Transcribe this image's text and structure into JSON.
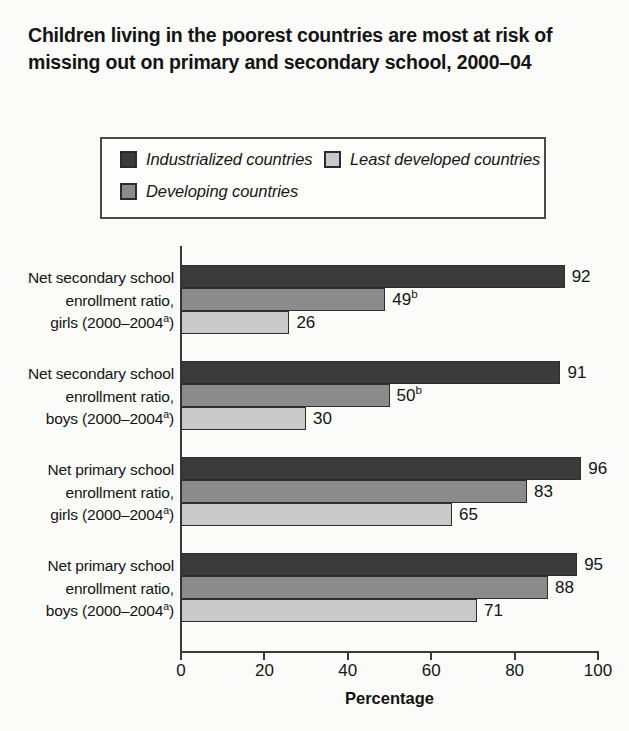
{
  "title": {
    "line1": "Children living in the poorest countries are most at risk of",
    "line2": "missing out on primary and secondary school, 2000–04"
  },
  "legend": {
    "items": [
      {
        "label": "Industrialized countries",
        "color": "#3b3b3b",
        "swatch_name": "legend-swatch-industrialized"
      },
      {
        "label": "Least developed countries",
        "color": "#c9c9c9",
        "swatch_name": "legend-swatch-least-developed"
      },
      {
        "label": "Developing countries",
        "color": "#8b8b8b",
        "swatch_name": "legend-swatch-developing"
      }
    ]
  },
  "axis": {
    "x_title": "Percentage",
    "ticks": [
      "0",
      "20",
      "40",
      "60",
      "80",
      "100"
    ]
  },
  "chart_data": {
    "type": "bar",
    "orientation": "horizontal",
    "title": "Children living in the poorest countries are most at risk of missing out on primary and secondary school, 2000–04",
    "xlabel": "Percentage",
    "ylabel": "",
    "xlim": [
      0,
      100
    ],
    "xticks": [
      0,
      20,
      40,
      60,
      80,
      100
    ],
    "grid": false,
    "legend_position": "top",
    "categories": [
      "Net secondary school enrollment ratio, girls (2000–2004a)",
      "Net secondary school enrollment ratio, boys (2000–2004a)",
      "Net primary school enrollment ratio, girls (2000–2004a)",
      "Net primary school enrollment ratio, boys (2000–2004a)"
    ],
    "series": [
      {
        "name": "Industrialized countries",
        "color": "#3b3b3b",
        "values": [
          92,
          91,
          96,
          95
        ],
        "labels": [
          "92",
          "91",
          "96",
          "95"
        ]
      },
      {
        "name": "Developing countries",
        "color": "#8b8b8b",
        "values": [
          49,
          50,
          83,
          88
        ],
        "labels": [
          "49",
          "50",
          "83",
          "88"
        ],
        "label_superscripts": [
          "b",
          "b",
          "",
          ""
        ]
      },
      {
        "name": "Least developed countries",
        "color": "#c9c9c9",
        "values": [
          26,
          30,
          65,
          71
        ],
        "labels": [
          "26",
          "30",
          "65",
          "71"
        ]
      }
    ],
    "footnote_markers": [
      "a",
      "b"
    ]
  },
  "groups": [
    {
      "label_lines": [
        "Net secondary school",
        "enrollment ratio,",
        "girls (2000–2004"
      ],
      "label_sup": "a",
      "label_tail": ")",
      "bars": [
        {
          "series": "Industrialized countries",
          "value": 92,
          "label": "92",
          "sup": "",
          "color": "#3b3b3b"
        },
        {
          "series": "Developing countries",
          "value": 49,
          "label": "49",
          "sup": "b",
          "color": "#8b8b8b"
        },
        {
          "series": "Least developed countries",
          "value": 26,
          "label": "26",
          "sup": "",
          "color": "#c9c9c9"
        }
      ]
    },
    {
      "label_lines": [
        "Net secondary school",
        "enrollment ratio,",
        "boys (2000–2004"
      ],
      "label_sup": "a",
      "label_tail": ")",
      "bars": [
        {
          "series": "Industrialized countries",
          "value": 91,
          "label": "91",
          "sup": "",
          "color": "#3b3b3b"
        },
        {
          "series": "Developing countries",
          "value": 50,
          "label": "50",
          "sup": "b",
          "color": "#8b8b8b"
        },
        {
          "series": "Least developed countries",
          "value": 30,
          "label": "30",
          "sup": "",
          "color": "#c9c9c9"
        }
      ]
    },
    {
      "label_lines": [
        "Net primary school",
        "enrollment ratio,",
        "girls (2000–2004"
      ],
      "label_sup": "a",
      "label_tail": ")",
      "bars": [
        {
          "series": "Industrialized countries",
          "value": 96,
          "label": "96",
          "sup": "",
          "color": "#3b3b3b"
        },
        {
          "series": "Developing countries",
          "value": 83,
          "label": "83",
          "sup": "",
          "color": "#8b8b8b"
        },
        {
          "series": "Least developed countries",
          "value": 65,
          "label": "65",
          "sup": "",
          "color": "#c9c9c9"
        }
      ]
    },
    {
      "label_lines": [
        "Net primary school",
        "enrollment ratio,",
        "boys (2000–2004"
      ],
      "label_sup": "a",
      "label_tail": ")",
      "bars": [
        {
          "series": "Industrialized countries",
          "value": 95,
          "label": "95",
          "sup": "",
          "color": "#3b3b3b"
        },
        {
          "series": "Developing countries",
          "value": 88,
          "label": "88",
          "sup": "",
          "color": "#8b8b8b"
        },
        {
          "series": "Least developed countries",
          "value": 71,
          "label": "71",
          "sup": "",
          "color": "#c9c9c9"
        }
      ]
    }
  ]
}
